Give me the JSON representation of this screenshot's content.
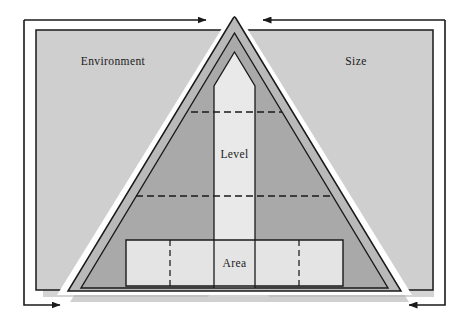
{
  "diagram": {
    "type": "nested-pyramid-hierarchy-diagram",
    "panels": {
      "left": {
        "label": "Environment"
      },
      "right": {
        "label": "Size"
      }
    },
    "pyramid": {
      "bands": [
        {
          "label": "Level"
        },
        {
          "label": "Area"
        }
      ],
      "center_column_label": "Level",
      "base_band_label": "Area"
    },
    "arrows": [
      {
        "name": "top-left-arrow",
        "direction": "right",
        "points_to": "apex"
      },
      {
        "name": "top-right-arrow",
        "direction": "left",
        "points_to": "apex"
      },
      {
        "name": "bottom-left-arrow",
        "direction": "right",
        "points_to": "base"
      },
      {
        "name": "bottom-right-arrow",
        "direction": "left",
        "points_to": "base"
      }
    ],
    "colors": {
      "panel_fill": "#cfcfcf",
      "pyramid_outer_fill": "#b9b9b9",
      "pyramid_mid_fill": "#a9a9a9",
      "column_fill": "#e9e9e9",
      "base_band_fill": "#e4e4e4",
      "shadow": "#b0b0b0",
      "stroke": "#1a1a1a",
      "background": "#ffffff"
    }
  }
}
